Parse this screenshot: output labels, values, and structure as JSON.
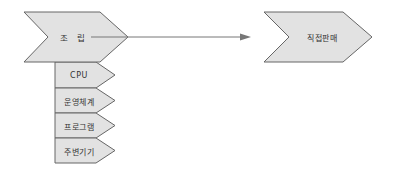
{
  "diagram": {
    "type": "value-chain-chevrons",
    "colors": {
      "fill": "#e2e2e2",
      "stroke": "#666666",
      "connector": "#777777",
      "text": "#333333"
    },
    "main_stage": {
      "label": "조 립"
    },
    "sub_items": [
      {
        "label": "CPU"
      },
      {
        "label": "운영체계"
      },
      {
        "label": "프로그램"
      },
      {
        "label": "주변기기"
      }
    ],
    "target_stage": {
      "label": "직접판매"
    },
    "connector": {
      "from": "조 립",
      "to": "직접판매",
      "arrow": "filled-triangle"
    }
  }
}
